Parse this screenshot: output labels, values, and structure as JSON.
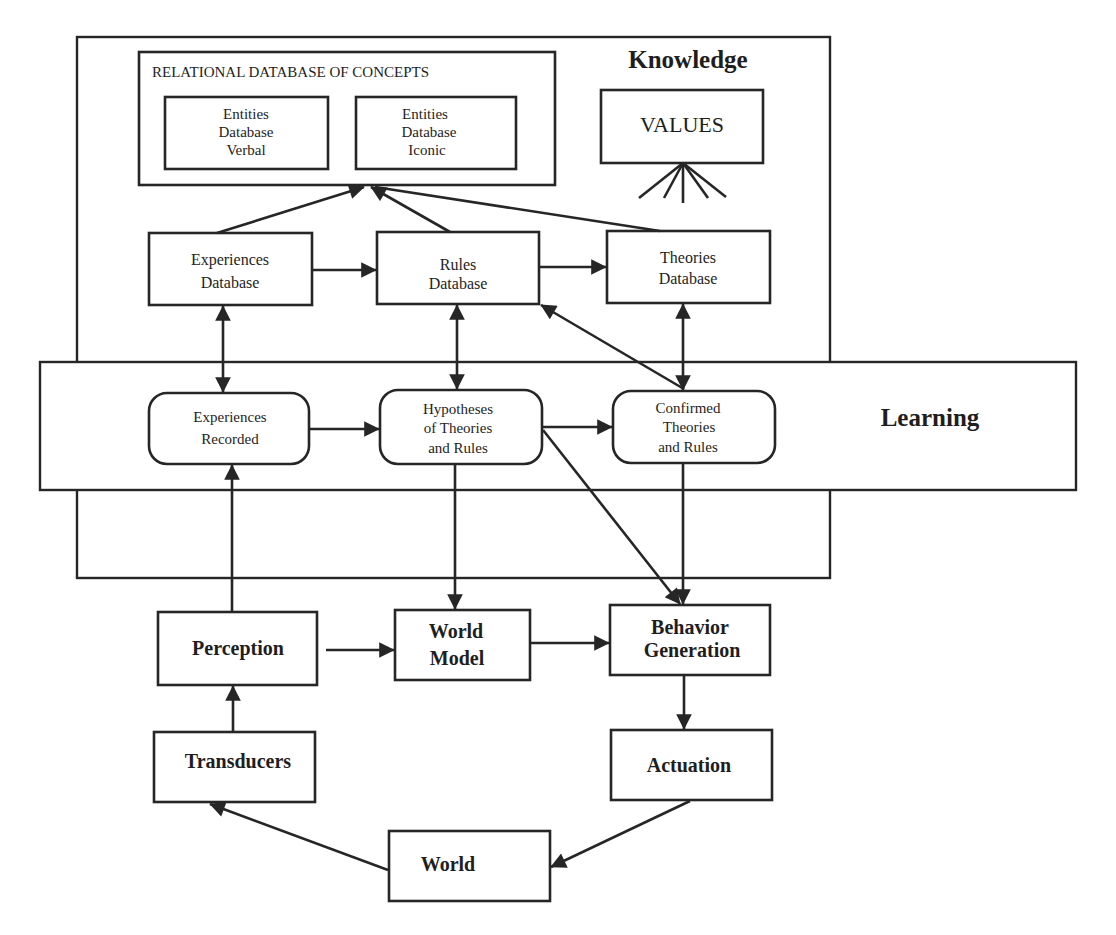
{
  "diagram": {
    "colors": {
      "stroke": "#262626",
      "text": "#1e1e1e",
      "background": "#ffffff"
    },
    "regions": {
      "knowledge": {
        "title": "Knowledge"
      },
      "learning": {
        "title": "Learning"
      }
    },
    "relational_db": {
      "title": "RELATIONAL DATABASE OF CONCEPTS",
      "verbal": {
        "lines": [
          "Entities",
          "Database",
          "Verbal"
        ]
      },
      "iconic": {
        "lines": [
          "Entities",
          "Database",
          "Iconic"
        ]
      }
    },
    "values": {
      "label": "VALUES"
    },
    "databases": {
      "experiences": {
        "lines": [
          "Experiences",
          "Database"
        ]
      },
      "rules": {
        "lines": [
          "Rules",
          "Database"
        ]
      },
      "theories": {
        "lines": [
          "Theories",
          "Database"
        ]
      }
    },
    "learning_nodes": {
      "experiences_recorded": {
        "lines": [
          "Experiences",
          "Recorded"
        ]
      },
      "hypotheses": {
        "lines": [
          "Hypotheses",
          "of Theories",
          "and Rules"
        ]
      },
      "confirmed": {
        "lines": [
          "Confirmed",
          "Theories",
          "and Rules"
        ]
      }
    },
    "processing": {
      "perception": {
        "lines": [
          "Perception"
        ]
      },
      "world_model": {
        "lines": [
          "World",
          "Model"
        ]
      },
      "behavior_generation": {
        "lines": [
          "Behavior",
          "Generation"
        ]
      },
      "transducers": {
        "lines": [
          "Transducers"
        ]
      },
      "actuation": {
        "lines": [
          "Actuation"
        ]
      },
      "world": {
        "lines": [
          "World"
        ]
      }
    },
    "edges": [
      {
        "from": "Experiences Database",
        "to": "Relational Database of Concepts"
      },
      {
        "from": "Rules Database",
        "to": "Relational Database of Concepts"
      },
      {
        "from": "Theories Database",
        "to": "Relational Database of Concepts"
      },
      {
        "from": "Experiences Database",
        "to": "Rules Database"
      },
      {
        "from": "Rules Database",
        "to": "Theories Database"
      },
      {
        "from": "Experiences Database",
        "to": "Experiences Recorded",
        "bidirectional": true
      },
      {
        "from": "Rules Database",
        "to": "Hypotheses of Theories and Rules",
        "bidirectional": true
      },
      {
        "from": "Theories Database",
        "to": "Confirmed Theories and Rules",
        "bidirectional": true
      },
      {
        "from": "Confirmed Theories and Rules",
        "to": "Rules Database"
      },
      {
        "from": "Experiences Recorded",
        "to": "Hypotheses of Theories and Rules"
      },
      {
        "from": "Hypotheses of Theories and Rules",
        "to": "Confirmed Theories and Rules"
      },
      {
        "from": "Hypotheses of Theories and Rules",
        "to": "World Model"
      },
      {
        "from": "Hypotheses of Theories and Rules",
        "to": "Behavior Generation"
      },
      {
        "from": "Confirmed Theories and Rules",
        "to": "Behavior Generation"
      },
      {
        "from": "Perception",
        "to": "Experiences Recorded"
      },
      {
        "from": "Perception",
        "to": "World Model"
      },
      {
        "from": "World Model",
        "to": "Behavior Generation"
      },
      {
        "from": "Transducers",
        "to": "Perception"
      },
      {
        "from": "Behavior Generation",
        "to": "Actuation"
      },
      {
        "from": "Actuation",
        "to": "World"
      },
      {
        "from": "World",
        "to": "Transducers"
      }
    ]
  }
}
